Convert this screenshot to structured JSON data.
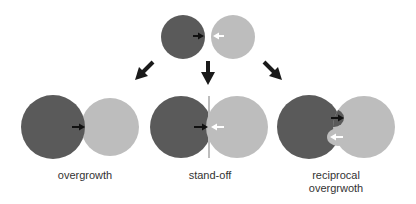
{
  "colors": {
    "dark_circle": "#5a5a5a",
    "light_circle": "#bdbdbd",
    "arrow": "#1a1a1a",
    "white_arrow": "#ffffff"
  },
  "diagram": {
    "top": {
      "description": "two colonies approaching"
    },
    "outcomes": [
      {
        "label": "overgrowth"
      },
      {
        "label": "stand-off"
      },
      {
        "label_line1": "reciprocal",
        "label_line2": "overgrwoth"
      }
    ]
  }
}
